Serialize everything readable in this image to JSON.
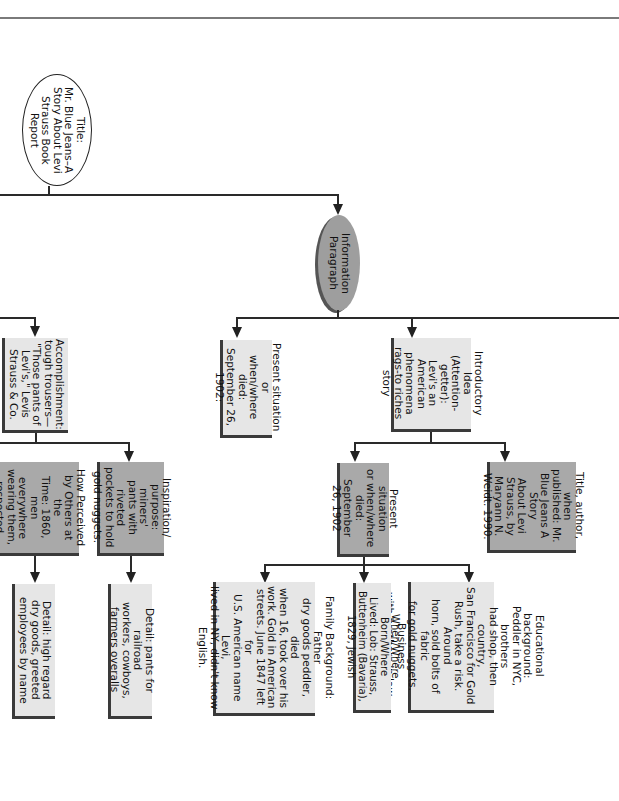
{
  "diagram": {
    "type": "book-report-graphic-organizer",
    "orientation": "rotated-90-clockwise",
    "title_node": {
      "label": "Title:\nMr. Blue Jeans–A\nStory About Levi\nStrauss Book\nReport"
    },
    "info_paragraph": {
      "label": "Information\nParagraph"
    },
    "nodes": {
      "introductory_idea": "Introductory Idea\n(Attention-getter):\nLevi's an American\nphenomena\nrags-to riches\nstory",
      "present_situation_died": "Present situation or\nwhen/where died:\nSeptember 26,\n1902:",
      "title_author": "Title, author, when\npublished: Mr.\nBlue Jeans A Story\nAbout Levi\nStrauss, by\nMaryann N.\nWeidt. 1990.",
      "present_situation_2": "Present situation\nor when/where\ndied: September\n26, 1902",
      "educational_background": "Educational background:\nPeddler in NYC, brothers\nhad shop, then country,\nSan Francisco for Gold\nRush, take a risk. Around\nhorn, sold bolts of fabric\nfor gold nuggets. Business\nwith brothers in law, cloth\nfrom brothers.",
      "born_lived": "When/Where Born/Where\nLived: Lob: Strauss,\nButtenheim (Bavaria),\n1829, Jewish",
      "family_background": "Family Background: Father\ndry goods peddler, died\nwhen 16, took over his\nwork. Gold in American\nstreets. June 1847 left for\nU.S. American name Levi,\nlived in NY, didn't know\nEnglish.",
      "accomplishment": "Accomplishment:\ntough trousers—\n\"Those pants of\nLevi's,\" Levis\nStrauss & Co.",
      "inspiration": "Inspiration/\npurpose: miners'\npants with riveted\npockets to hold\ngold nuggets.",
      "how_perceived": "How Perceived\nby Others at the\nTime: 1860,\nmen everywhere\nwearing them,\nrespected",
      "detail_railroad": "Detail: pants for railroad\nworkers, cowboys,\nfarmers overalls",
      "detail_high_regard": "Detail: high regard\ndry goods, greeted\nemployees by name"
    },
    "colors": {
      "light_box": "#e6e6e6",
      "gray_box": "#a9a9a9",
      "info_oval": "#9e9e9e",
      "lines": "#2a2a2a"
    }
  }
}
